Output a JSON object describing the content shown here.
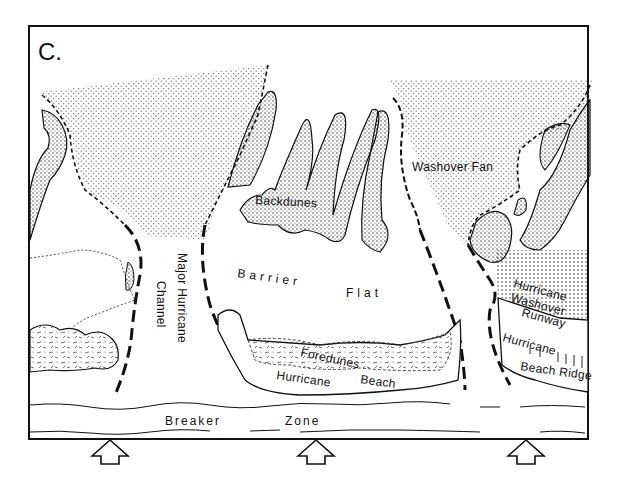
{
  "figure": {
    "panel_label": "C.",
    "labels": {
      "washover_fan": "Washover Fan",
      "backdunes": "Backdunes",
      "barrier": "Barrier",
      "flat": "Flat",
      "major_hurricane": "Major Hurricane",
      "channel": "Channel",
      "foredunes": "Foredunes",
      "hurricane_beach_1": "Hurricane",
      "hurricane_beach_2": "Beach",
      "hurricane_washover_runway_1": "Hurricane",
      "hurricane_washover_runway_2": "Washover",
      "hurricane_washover_runway_3": "Runway",
      "hurricane_beach_ridge_1": "Hurricane",
      "hurricane_beach_ridge_2": "Beach Ridge",
      "breaker": "Breaker",
      "zone": "Zone"
    },
    "wave_arrows_count": 3,
    "colors": {
      "ink": "#111111",
      "paper": "#ffffff",
      "stipple": "#555555"
    }
  }
}
